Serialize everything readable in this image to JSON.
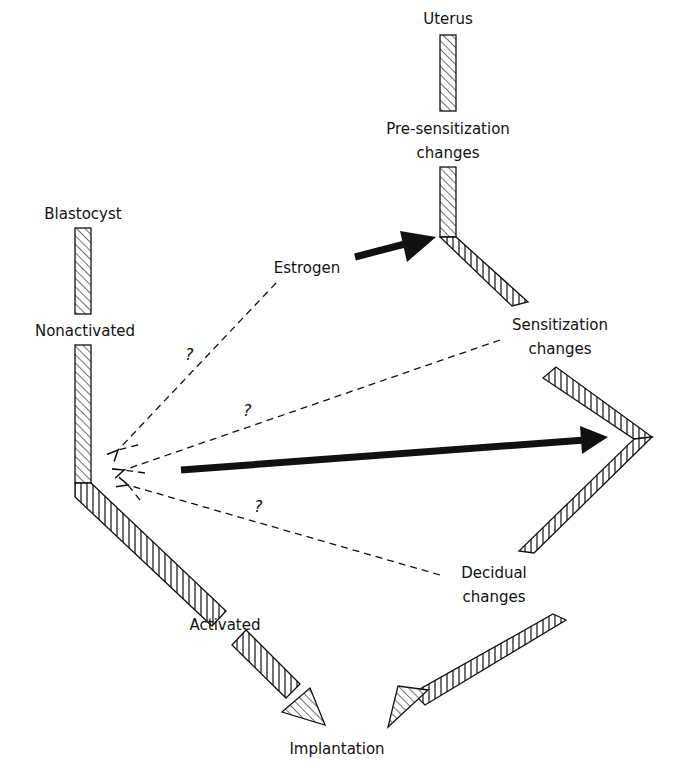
{
  "diagram": {
    "labels": {
      "uterus": "Uterus",
      "pre_sensitization_1": "Pre-sensitization",
      "pre_sensitization_2": "changes",
      "blastocyst": "Blastocyst",
      "estrogen": "Estrogen",
      "nonactivated": "Nonactivated",
      "sensitization_1": "Sensitization",
      "sensitization_2": "changes",
      "decidual_1": "Decidual",
      "decidual_2": "changes",
      "activated": "Activated",
      "implantation": "Implantation"
    },
    "question_marks": [
      "?",
      "?",
      "?"
    ],
    "colors": {
      "ink": "#111111",
      "background": "#ffffff"
    }
  }
}
